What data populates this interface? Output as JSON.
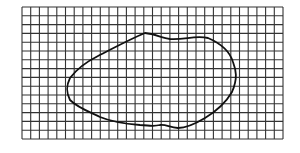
{
  "diagram": {
    "grid": {
      "x": 22,
      "y": 7,
      "width": 261,
      "height": 132,
      "cols": 30,
      "rows": 15,
      "line_color": "#333333"
    },
    "shape": {
      "type": "closed-curve",
      "stroke_color": "#111111",
      "path": "M145,33 C155,34 162,38 170,39 C185,40 195,35 208,38 C222,44 230,52 233,62 C236,70 238,78 232,92 C225,104 215,112 205,118 C195,124 185,128 178,128 C170,128 166,124 160,125 C152,127 148,125 140,125 C128,124 112,122 100,117 C90,112 78,108 70,100 C66,92 66,86 70,78 C76,70 86,62 98,56 C112,49 128,40 145,33 Z"
    }
  }
}
